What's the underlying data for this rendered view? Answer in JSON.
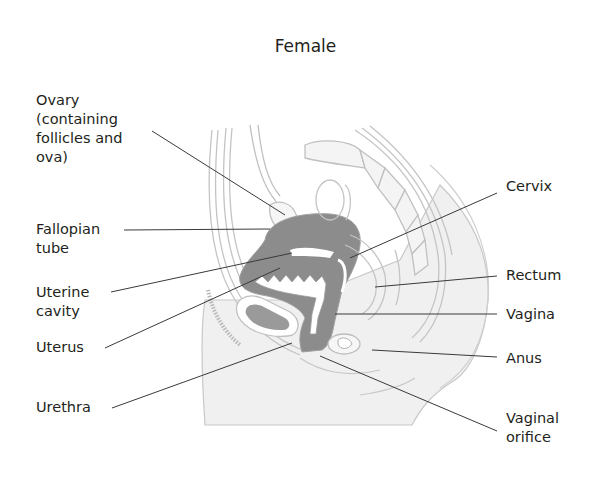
{
  "diagram": {
    "title": "Female",
    "type": "sagittal-section",
    "colors": {
      "text": "#231f20",
      "leader_line": "#3a3a3a",
      "outline": "#bdbdbd",
      "organ_fill": "#8c8c8c",
      "body_fill": "#f0f0f0"
    },
    "labels_left": [
      {
        "id": "ovary",
        "text": "Ovary\n(containing\nfollicles and\nova)"
      },
      {
        "id": "fallopian-tube",
        "text": "Fallopian\ntube"
      },
      {
        "id": "uterine-cavity",
        "text": "Uterine\ncavity"
      },
      {
        "id": "uterus",
        "text": "Uterus"
      },
      {
        "id": "urethra",
        "text": "Urethra"
      }
    ],
    "labels_right": [
      {
        "id": "cervix",
        "text": "Cervix"
      },
      {
        "id": "rectum",
        "text": "Rectum"
      },
      {
        "id": "vagina",
        "text": "Vagina"
      },
      {
        "id": "anus",
        "text": "Anus"
      },
      {
        "id": "vaginal-orifice",
        "text": "Vaginal\norifice"
      }
    ]
  }
}
